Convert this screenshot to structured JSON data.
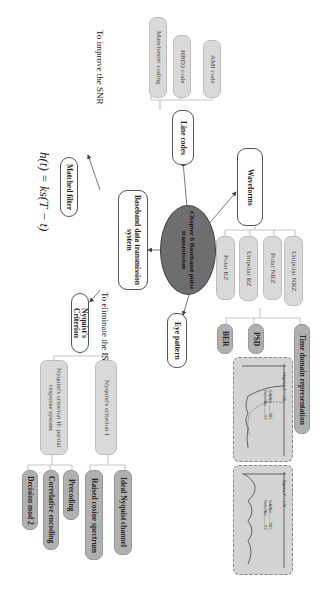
{
  "center": {
    "label": "Chapter 6 Baseband pulse transmission"
  },
  "branches": {
    "line_codes": {
      "label": "Line codes",
      "children": [
        "AMI code",
        "HBD3 code",
        "Manchester coding"
      ]
    },
    "waveforms": {
      "label": "Waveforms",
      "children": [
        "Unipolar NRZ",
        "Polar NRZ",
        "Unipolar RZ",
        "Polar RZ"
      ],
      "analysis": [
        "Time domain representation",
        "PSD",
        "BER"
      ]
    },
    "eye_pattern": {
      "label": "Eye pattern"
    },
    "baseband_system": {
      "label": "Baseband data transmission system"
    },
    "matched_filter": {
      "label": "Matched filter",
      "annotation": "To improve the SNR",
      "formula": "h(t) = ks(T − t)"
    },
    "nyquist": {
      "label": "Nyquist's Criterion",
      "annotation": "To eliminate the ISI",
      "criterion1": {
        "label": "Nyquist's criterion I",
        "children": [
          "Ideal Nyquist channel",
          "Raised cosine spectrum"
        ]
      },
      "criterion2": {
        "label": "Nyquist's criterion II: partial response system",
        "children": [
          "Precoding",
          "Correlative encoding",
          "Decision mod 2"
        ]
      }
    }
  },
  "plots": [
    {
      "title": "Unipolar (P = 1/2)",
      "legend_solid": "Solid line —— NRZ",
      "legend_dashed": "Dashed line —— RZ",
      "x_ticks": [
        "0",
        "fs",
        "2fs",
        "f"
      ]
    },
    {
      "title": "Bipolar (P = 1/2)",
      "legend_solid": "Solid line —— NRZ",
      "legend_dashed": "Dashed line —— RZ",
      "x_ticks": [
        "0",
        "fs",
        "2fs",
        "f"
      ]
    }
  ],
  "colors": {
    "center": "#6e6e6e",
    "light_node": "#d9d9d9",
    "mid_node": "#b0b0b0",
    "plot_bg": "#d4d4d4"
  }
}
